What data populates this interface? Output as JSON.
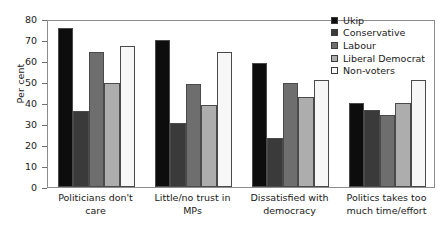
{
  "chart_data": {
    "type": "bar",
    "title": "",
    "xlabel": "",
    "ylabel": "Per cent",
    "ylim": [
      0,
      80
    ],
    "yticks": [
      0,
      10,
      20,
      30,
      40,
      50,
      60,
      70,
      80
    ],
    "grid": false,
    "legend_position": "top-right",
    "categories": [
      "Politicians don't care",
      "Little/no trust in MPs",
      "Dissatisfied with democracy",
      "Politics takes too much time/effort"
    ],
    "category_lines": [
      [
        "Politicians don't",
        "care"
      ],
      [
        "Little/no trust in",
        "MPs"
      ],
      [
        "Dissatisfied with",
        "democracy"
      ],
      [
        "Politics takes too",
        "much time/effort"
      ]
    ],
    "series": [
      {
        "name": "Ukip",
        "color": "#0d0d0d",
        "values": [
          75.5,
          70.0,
          59.0,
          40.0
        ]
      },
      {
        "name": "Conservative",
        "color": "#3a3a3a",
        "values": [
          36.0,
          30.5,
          23.5,
          36.5
        ]
      },
      {
        "name": "Labour",
        "color": "#6e6e6e",
        "values": [
          64.5,
          49.0,
          49.5,
          34.5
        ]
      },
      {
        "name": "Liberal Democrat",
        "color": "#adadad",
        "values": [
          49.5,
          39.0,
          43.0,
          40.0
        ]
      },
      {
        "name": "Non-voters",
        "color": "#f7f7f7",
        "values": [
          67.0,
          64.5,
          51.0,
          51.0
        ]
      }
    ]
  }
}
